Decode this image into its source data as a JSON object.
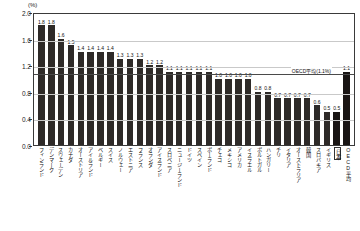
{
  "axis": {
    "unit_label": "(%)",
    "y_ticks": [
      "2.0",
      "1.6",
      "1.2",
      "0.8",
      "0.4",
      "0.0"
    ]
  },
  "annotation": {
    "oecd_average_note": "OECD平均(1.1%)"
  },
  "chart_data": {
    "type": "bar",
    "title": "",
    "xlabel": "",
    "ylabel": "(%)",
    "ylim": [
      0.0,
      2.0
    ],
    "ytick_values": [
      2.0,
      1.6,
      1.2,
      0.8,
      0.4,
      0.0
    ],
    "grid": true,
    "legend": "none",
    "reference_line": {
      "label": "OECD平均(1.1%)",
      "value": 1.1
    },
    "categories": [
      "フィンランド",
      "デンマーク",
      "スウェーデン",
      "カナダ",
      "オーストリア",
      "アイルランド",
      "ベルギー",
      "スイス",
      "ノルウェー",
      "エストニア",
      "フランス",
      "オランダ",
      "アイスランド",
      "スロベニア",
      "ニュージーランド",
      "ドイツ",
      "スペイン",
      "ポーランド",
      "チェコ",
      "メキシコ",
      "アメリカ",
      "イスラエル",
      "ポルトガル",
      "ハンガリー",
      "チリ",
      "イタリア",
      "オーストラリア",
      "韓国",
      "スロバキア",
      "イギリス",
      "日本",
      "OECD平均"
    ],
    "values": [
      1.8,
      1.8,
      1.6,
      1.5,
      1.4,
      1.4,
      1.4,
      1.4,
      1.3,
      1.3,
      1.3,
      1.2,
      1.2,
      1.1,
      1.1,
      1.1,
      1.1,
      1.1,
      1.0,
      1.0,
      1.0,
      1.0,
      0.8,
      0.8,
      0.7,
      0.7,
      0.7,
      0.7,
      0.6,
      0.5,
      0.5,
      1.1
    ],
    "value_labels": [
      "1.8",
      "1.8",
      "1.6",
      "1.5",
      "1.4",
      "1.4",
      "1.4",
      "1.4",
      "1.3",
      "1.3",
      "1.3",
      "1.2",
      "1.2",
      "1.1",
      "1.1",
      "1.1",
      "1.1",
      "1.1",
      "1.0",
      "1.0",
      "1.0",
      "1.0",
      "0.8",
      "0.8",
      "0.7",
      "0.7",
      "0.7",
      "0.7",
      "0.6",
      "0.5",
      "0.5",
      "1.1"
    ],
    "highlighted_categories": [
      "日本",
      "OECD平均"
    ]
  }
}
